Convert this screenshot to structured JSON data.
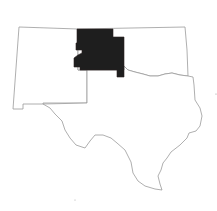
{
  "map": {
    "title": "",
    "region_shown": "New Mexico, Texas, Oklahoma",
    "states": [
      {
        "name": "New Mexico",
        "highlighted": false
      },
      {
        "name": "Texas",
        "highlighted": false
      },
      {
        "name": "Oklahoma",
        "highlighted": false
      }
    ],
    "highlighted_area": {
      "description": "Texas/Oklahoma panhandle region",
      "color": "#1e1e1e"
    },
    "colors": {
      "outline": "#9a9a9a",
      "background": "#ffffff",
      "highlight": "#1e1e1e",
      "top_border_left": "#e8a0c8",
      "top_border_mid": "#80e0d0",
      "top_border_right": "#b8f090"
    }
  }
}
